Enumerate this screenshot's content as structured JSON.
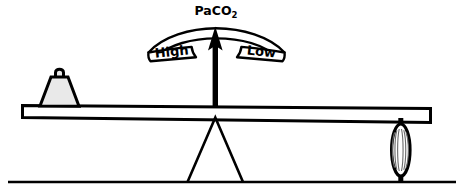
{
  "figure": {
    "type": "seesaw-balance-diagram",
    "subject": "PaCO2",
    "background_color": "#ffffff",
    "line_color": "#000000"
  },
  "gauge": {
    "title": "PaCO",
    "title_subscript": "2",
    "title_full": "PaCO2",
    "left_label": "High",
    "right_label": "Low",
    "needle_direction": "up",
    "needle_position": "center"
  },
  "beam": {
    "name": "lever-plank",
    "fill_color": "#ffffff",
    "tilt": "down-to-the-right"
  },
  "left_load": {
    "name": "weight-block",
    "shape": "trapezoid",
    "fill_color": "#e9e9e9",
    "has_handle": true
  },
  "right_load": {
    "name": "spring-element",
    "shape": "lens-coil",
    "fill_color": "#ffffff",
    "coil_count": 7
  },
  "fulcrum": {
    "name": "triangle-pivot",
    "shape": "triangle"
  },
  "ground": {
    "name": "ground-line"
  }
}
